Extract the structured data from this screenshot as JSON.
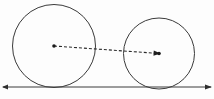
{
  "figure": {
    "background_color": "#fdfdfd",
    "stroke_color": "#3a3a3a",
    "dashed_color": "#2b2b2b",
    "width": 214,
    "height": 99
  },
  "chart_data": {
    "type": "diagram",
    "title": "",
    "xlabel": "",
    "ylabel": "",
    "grid": false,
    "legend": null,
    "xlim": [
      0,
      214
    ],
    "ylim": [
      0,
      99
    ],
    "elements": [
      {
        "name": "baseline",
        "kind": "line",
        "x1": 3,
        "y1": 87,
        "x2": 211,
        "y2": 87,
        "stroke": "#3a3a3a",
        "stroke_width": 1,
        "arrow_start": true,
        "arrow_end": true
      },
      {
        "name": "large-circle",
        "kind": "circle",
        "cx": 54,
        "cy": 46,
        "r": 41.5,
        "stroke": "#3a3a3a",
        "stroke_width": 1,
        "fill": "none"
      },
      {
        "name": "small-circle",
        "kind": "circle",
        "cx": 159,
        "cy": 53.5,
        "r": 35.5,
        "stroke": "#3a3a3a",
        "stroke_width": 1,
        "fill": "none"
      },
      {
        "name": "center-segment",
        "kind": "dashed-line",
        "x1": 54,
        "y1": 46,
        "x2": 159,
        "y2": 53.5,
        "stroke": "#2b2b2b",
        "stroke_width": 1.1,
        "dash": "3 2",
        "marker_start": "dot",
        "marker_end": "arrow"
      },
      {
        "name": "large-circle-center-dot",
        "kind": "dot",
        "cx": 54,
        "cy": 46,
        "r": 1.8,
        "fill": "#1a1a1a"
      },
      {
        "name": "small-circle-center-dot",
        "kind": "dot",
        "cx": 159,
        "cy": 53.5,
        "r": 1.8,
        "fill": "#1a1a1a"
      }
    ]
  }
}
